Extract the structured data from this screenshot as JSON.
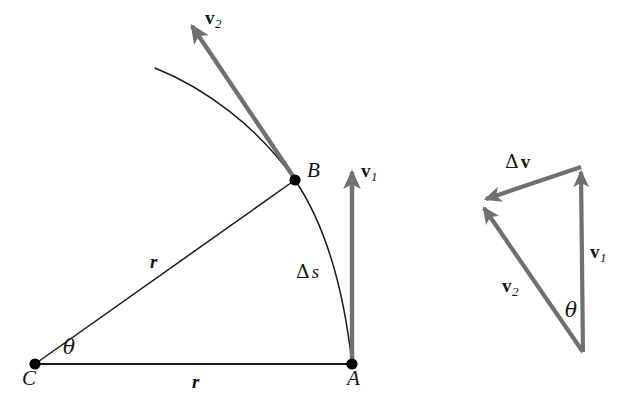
{
  "figure": {
    "background_color": "#ffffff",
    "line_color": "#1a1a1a",
    "vector_color": "#707070",
    "point_color": "#000000",
    "width": 635,
    "height": 412
  },
  "left_diagram": {
    "name": "circular-path-geometry",
    "points": [
      {
        "id": "A",
        "label": "A",
        "x": 352,
        "y": 364,
        "label_x": 347,
        "label_y": 374
      },
      {
        "id": "B",
        "label": "B",
        "x": 295,
        "y": 180,
        "label_x": 307,
        "label_y": 167
      },
      {
        "id": "C",
        "label": "C",
        "x": 35,
        "y": 364,
        "label_x": 22,
        "label_y": 374
      }
    ],
    "radius_label_cb": "r",
    "radius_label_ca": "r",
    "arc_label": "s",
    "arc_delta": "Δ",
    "angle_label": "θ",
    "vector_v1": {
      "sym": "v",
      "sub": "1"
    },
    "vector_v2": {
      "sym": "v",
      "sub": "2"
    }
  },
  "right_diagram": {
    "name": "vector-subtraction-triangle",
    "delta_v": {
      "delta": "Δ",
      "sym": "v"
    },
    "vector_v1": {
      "sym": "v",
      "sub": "1"
    },
    "vector_v2": {
      "sym": "v",
      "sub": "2"
    },
    "angle_label": "θ",
    "vertices": {
      "top_right": {
        "x": 581,
        "y": 167
      },
      "bottom": {
        "x": 583,
        "y": 352
      },
      "left": {
        "x": 481,
        "y": 201
      }
    }
  }
}
